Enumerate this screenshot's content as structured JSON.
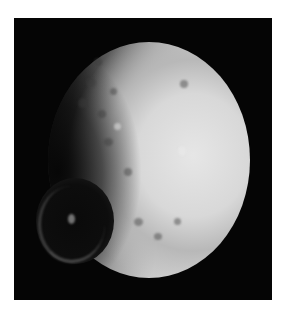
{
  "image": {
    "subject": "Cratered moon with a large crater on its left limb",
    "colors": {
      "page_background": "#ffffff",
      "space_background": "#050505",
      "moon_bright": "#dcdcdc",
      "moon_mid": "#a8a8a8",
      "crater_interior": "#0a0a0a"
    }
  }
}
